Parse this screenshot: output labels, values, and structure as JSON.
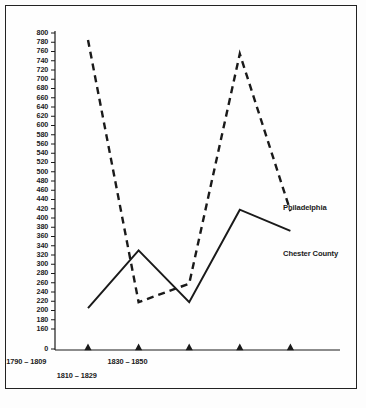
{
  "chart_data": {
    "type": "line",
    "title": "",
    "xlabel": "",
    "ylabel": "",
    "grid": false,
    "legend_position": "inline-right",
    "categories": [
      "1750 – 1769",
      "1770 – 1789",
      "1790 – 1809",
      "1810 – 1829",
      "1830 – 1850"
    ],
    "ylim": [
      0,
      800
    ],
    "y_axis_break": true,
    "y_break_from": 0,
    "y_break_to": 160,
    "yticks": [
      0,
      160,
      180,
      200,
      220,
      240,
      260,
      280,
      300,
      320,
      340,
      360,
      380,
      400,
      420,
      440,
      460,
      480,
      500,
      520,
      540,
      560,
      580,
      600,
      620,
      640,
      660,
      680,
      700,
      720,
      740,
      760,
      780,
      800
    ],
    "ytick_labels": [
      "0",
      "160",
      "180",
      "200",
      "220",
      "240",
      "260",
      "280",
      "300",
      "320",
      "340",
      "360",
      "380",
      "400",
      "420",
      "440",
      "460",
      "480",
      "500",
      "520",
      "540",
      "560",
      "580",
      "600",
      "620",
      "640",
      "660",
      "680",
      "700",
      "720",
      "740",
      "760",
      "780",
      "800"
    ],
    "series": [
      {
        "name": "Philadelphia",
        "style": "dashed",
        "color": "#1a1a1a",
        "values": [
          785,
          218,
          258,
          755,
          415
        ]
      },
      {
        "name": "Chester County",
        "style": "solid",
        "color": "#1a1a1a",
        "values": [
          205,
          330,
          218,
          418,
          372
        ]
      }
    ],
    "annotations": [
      {
        "text": "Philadelphia",
        "series": "Philadelphia"
      },
      {
        "text": "Chester County",
        "series": "Chester County"
      }
    ]
  }
}
